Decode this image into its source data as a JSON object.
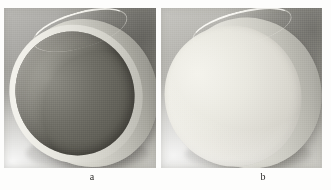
{
  "figure": {
    "type": "photographic-plate",
    "panels": [
      {
        "id": "a",
        "caption": "a",
        "subject": "cylindrical disc with dark recessed concave face",
        "face_tone": "dark gray",
        "rim_tone": "bright off-white",
        "background_tone": "light gray with dark upper-right field"
      },
      {
        "id": "b",
        "caption": "b",
        "subject": "cylindrical disc with bright flat face",
        "face_tone": "bright off-white",
        "rim_tone": "bright off-white",
        "background_tone": "light gray with dark upper-right field"
      }
    ]
  },
  "colors": {
    "page_background": "#fdfdfc",
    "panel_a_background_light": "#b9b8b4",
    "panel_a_background_dark": "#5a5951",
    "panel_a_cavity": "#64635b",
    "panel_a_rim": "#f6f5ef",
    "panel_b_background_light": "#c6c5c0",
    "panel_b_background_dark": "#60605a",
    "panel_b_face": "#efeee7",
    "panel_b_rim": "#f4f3ed",
    "caption_text": "#2d2c2a"
  }
}
